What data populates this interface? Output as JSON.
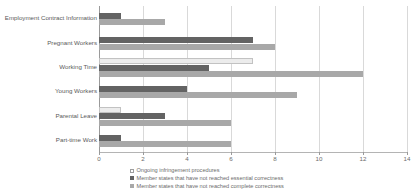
{
  "chart_data": {
    "type": "bar",
    "orientation": "horizontal",
    "title": "",
    "xlabel": "",
    "ylabel": "",
    "xlim": [
      0,
      14
    ],
    "xticks": [
      0,
      2,
      4,
      6,
      8,
      10,
      12,
      14
    ],
    "grid": true,
    "legend_position": "bottom",
    "categories": [
      "Employment Contract Information",
      "Pregnant Workers",
      "Working Time",
      "Young Workers",
      "Parental Leave",
      "Part-time Work"
    ],
    "series": [
      {
        "name": "Ongoing infringement procedures",
        "color": "#ececec",
        "values": [
          0,
          0,
          7,
          0,
          1,
          0
        ]
      },
      {
        "name": "Member states that have not reached essential correctness",
        "color": "#636363",
        "values": [
          1,
          7,
          5,
          4,
          3,
          1
        ]
      },
      {
        "name": "Member states that have not reached complete correctness",
        "color": "#a8a8a8",
        "values": [
          3,
          8,
          12,
          9,
          6,
          6
        ]
      }
    ]
  },
  "axis": {
    "tick_labels": [
      "0",
      "2",
      "4",
      "6",
      "8",
      "10",
      "12",
      "14"
    ]
  },
  "legend": {
    "items": [
      {
        "label": "Ongoing infringement procedures",
        "swatch": "series-ongoing"
      },
      {
        "label": "Member states that have not reached essential correctness",
        "swatch": "series-essential"
      },
      {
        "label": "Member states that have not reached complete correctness",
        "swatch": "series-complete"
      }
    ]
  }
}
